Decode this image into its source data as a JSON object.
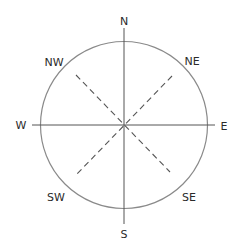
{
  "diagram": {
    "type": "compass-rose",
    "center": [
      124,
      125
    ],
    "radius": 83,
    "colors": {
      "circle": "#8a8a8a",
      "axes": "#555555",
      "diagonals": "#555555",
      "text": "#2a2a2a",
      "background": "#ffffff"
    },
    "cardinal_axes": {
      "vertical": {
        "from": [
          124,
          28
        ],
        "to": [
          124,
          224
        ]
      },
      "horizontal": {
        "from": [
          32,
          125
        ],
        "to": [
          215,
          125
        ]
      }
    },
    "diagonals": [
      {
        "name": "NW-SE",
        "from": [
          76,
          75
        ],
        "to": [
          170,
          172
        ],
        "style": "dashed"
      },
      {
        "name": "NE-SW",
        "from": [
          172,
          76
        ],
        "to": [
          75,
          176
        ],
        "style": "dashed"
      }
    ],
    "labels": {
      "n": {
        "text": "N",
        "pos": [
          124,
          21
        ]
      },
      "ne": {
        "text": "NE",
        "pos": [
          192,
          61
        ]
      },
      "e": {
        "text": "E",
        "pos": [
          224,
          126
        ]
      },
      "se": {
        "text": "SE",
        "pos": [
          189,
          197
        ]
      },
      "s": {
        "text": "S",
        "pos": [
          124,
          234
        ]
      },
      "sw": {
        "text": "SW",
        "pos": [
          56,
          197
        ]
      },
      "w": {
        "text": "W",
        "pos": [
          21,
          125
        ]
      },
      "nw": {
        "text": "NW",
        "pos": [
          54,
          62
        ]
      }
    }
  }
}
